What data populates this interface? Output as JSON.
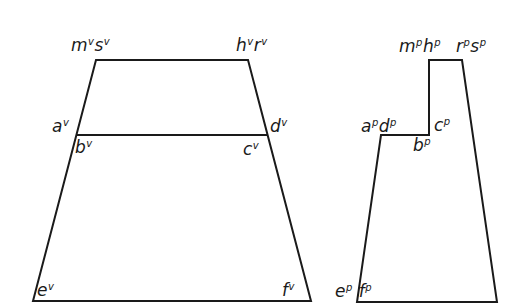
{
  "diagram": {
    "views": [
      {
        "name": "vertical-projection",
        "superscript": "v",
        "labels": [
          {
            "id": "ms",
            "parts": [
              {
                "base": "m",
                "sup": "v"
              },
              {
                "base": "s",
                "sup": "v"
              }
            ]
          },
          {
            "id": "hr",
            "parts": [
              {
                "base": "h",
                "sup": "v"
              },
              {
                "base": "r",
                "sup": "v"
              }
            ]
          },
          {
            "id": "a",
            "parts": [
              {
                "base": "a",
                "sup": "v"
              }
            ]
          },
          {
            "id": "d",
            "parts": [
              {
                "base": "d",
                "sup": "v"
              }
            ]
          },
          {
            "id": "b",
            "parts": [
              {
                "base": "b",
                "sup": "v"
              }
            ]
          },
          {
            "id": "c",
            "parts": [
              {
                "base": "c",
                "sup": "v"
              }
            ]
          },
          {
            "id": "e",
            "parts": [
              {
                "base": "e",
                "sup": "v"
              }
            ]
          },
          {
            "id": "f",
            "parts": [
              {
                "base": "f",
                "sup": "v"
              }
            ]
          }
        ],
        "outline": [
          [
            96,
            60
          ],
          [
            248,
            60
          ],
          [
            311,
            301
          ],
          [
            33,
            301
          ]
        ],
        "midline": [
          [
            77,
            135
          ],
          [
            267,
            135
          ]
        ]
      },
      {
        "name": "plan-projection",
        "superscript": "p",
        "labels": [
          {
            "id": "mh",
            "parts": [
              {
                "base": "m",
                "sup": "p"
              },
              {
                "base": "h",
                "sup": "p"
              }
            ]
          },
          {
            "id": "rs",
            "parts": [
              {
                "base": "r",
                "sup": "p"
              },
              {
                "base": "s",
                "sup": "p"
              }
            ]
          },
          {
            "id": "ad",
            "parts": [
              {
                "base": "a",
                "sup": "p"
              },
              {
                "base": "d",
                "sup": "p"
              }
            ]
          },
          {
            "id": "c",
            "parts": [
              {
                "base": "c",
                "sup": "p"
              }
            ]
          },
          {
            "id": "b",
            "parts": [
              {
                "base": "b",
                "sup": "p"
              }
            ]
          },
          {
            "id": "ef",
            "parts": [
              {
                "base": "e",
                "sup": "p"
              },
              {
                "base": "f",
                "sup": "p"
              }
            ]
          }
        ],
        "outline": [
          [
            429,
            60
          ],
          [
            462,
            60
          ],
          [
            497,
            302
          ],
          [
            357,
            302
          ],
          [
            381,
            135
          ],
          [
            429,
            135
          ]
        ]
      }
    ],
    "text": {
      "v_ms_m": "m",
      "v_ms_m_sup": "v",
      "v_ms_s": "s",
      "v_ms_s_sup": "v",
      "v_hr_h": "h",
      "v_hr_h_sup": "v",
      "v_hr_r": "r",
      "v_hr_r_sup": "v",
      "v_a": "a",
      "v_a_sup": "v",
      "v_d": "d",
      "v_d_sup": "v",
      "v_b": "b",
      "v_b_sup": "v",
      "v_c": "c",
      "v_c_sup": "v",
      "v_e": "e",
      "v_e_sup": "v",
      "v_f": "f",
      "v_f_sup": "v",
      "p_mh_m": "m",
      "p_mh_m_sup": "p",
      "p_mh_h": "h",
      "p_mh_h_sup": "p",
      "p_rs_r": "r",
      "p_rs_r_sup": "p",
      "p_rs_s": "s",
      "p_rs_s_sup": "p",
      "p_ad_a": "a",
      "p_ad_a_sup": "p",
      "p_ad_d": "d",
      "p_ad_d_sup": "p",
      "p_c": "c",
      "p_c_sup": "p",
      "p_b": "b",
      "p_b_sup": "p",
      "p_ef_e": "e",
      "p_ef_e_sup": "p",
      "p_ef_f": "f",
      "p_ef_f_sup": "p"
    },
    "colors": {
      "line": "#1a1a1a",
      "background": "#ffffff"
    }
  }
}
